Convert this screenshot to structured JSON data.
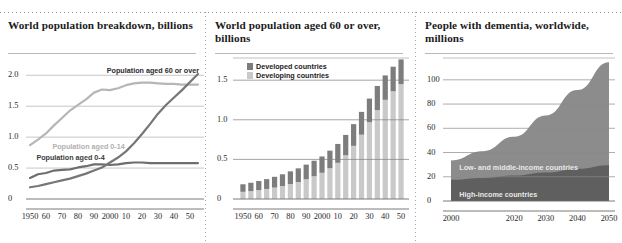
{
  "colors": {
    "dark_line": "#6e6e6e",
    "mid_line": "#8f8f8f",
    "light_line": "#b6b6b6",
    "bar_developed": "#7d7d7d",
    "bar_developing": "#c9c9c9",
    "area_low_mid": "#8c8c8c",
    "area_high": "#5f5f5f",
    "grid": "#b9b9b9",
    "axis": "#6b6b6b",
    "text": "#1b1b1b"
  },
  "panels": [
    {
      "title": "World population breakdown,\nbillions",
      "chart_data": {
        "type": "line",
        "title": "World population breakdown, billions",
        "xlabel": "",
        "ylabel": "billions",
        "xlim": [
          1950,
          2055
        ],
        "ylim": [
          0,
          2.15
        ],
        "grid": true,
        "legend_position": "inline-annotations",
        "y_ticks": [
          0,
          0.5,
          1.0,
          1.5,
          2.0
        ],
        "y_tick_labels": [
          "0",
          "0.5",
          "1.0",
          "1.5",
          "2.0"
        ],
        "x_ticks": [
          1950,
          1960,
          1970,
          1980,
          1990,
          2000,
          2010,
          2020,
          2030,
          2040,
          2050
        ],
        "x_tick_labels": [
          "1950",
          "60",
          "70",
          "80",
          "90",
          "2000",
          "10",
          "20",
          "30",
          "40",
          "50"
        ],
        "series": [
          {
            "name": "Population aged 0-14",
            "color": "#b6b6b6",
            "x": [
              1950,
              1955,
              1960,
              1965,
              1970,
              1975,
              1980,
              1985,
              1990,
              1995,
              2000,
              2005,
              2010,
              2015,
              2020,
              2025,
              2030,
              2035,
              2040,
              2045,
              2050,
              2055
            ],
            "values": [
              0.87,
              0.96,
              1.06,
              1.19,
              1.31,
              1.43,
              1.52,
              1.61,
              1.72,
              1.77,
              1.76,
              1.79,
              1.84,
              1.87,
              1.88,
              1.88,
              1.87,
              1.86,
              1.86,
              1.85,
              1.85,
              1.85
            ]
          },
          {
            "name": "Population aged 0-4",
            "color": "#6e6e6e",
            "x": [
              1950,
              1955,
              1960,
              1965,
              1970,
              1975,
              1980,
              1985,
              1990,
              1995,
              2000,
              2005,
              2010,
              2015,
              2020,
              2025,
              2030,
              2035,
              2040,
              2045,
              2050,
              2055
            ],
            "values": [
              0.34,
              0.4,
              0.42,
              0.46,
              0.47,
              0.48,
              0.51,
              0.53,
              0.56,
              0.56,
              0.55,
              0.56,
              0.58,
              0.59,
              0.59,
              0.58,
              0.58,
              0.58,
              0.58,
              0.58,
              0.58,
              0.58
            ]
          },
          {
            "name": "Population aged 60 or over",
            "color": "#767676",
            "x": [
              1950,
              1955,
              1960,
              1965,
              1970,
              1975,
              1980,
              1985,
              1990,
              1995,
              2000,
              2005,
              2010,
              2015,
              2020,
              2025,
              2030,
              2035,
              2040,
              2045,
              2050,
              2055
            ],
            "values": [
              0.19,
              0.21,
              0.24,
              0.27,
              0.3,
              0.33,
              0.37,
              0.41,
              0.46,
              0.51,
              0.59,
              0.67,
              0.77,
              0.9,
              1.05,
              1.21,
              1.38,
              1.52,
              1.64,
              1.76,
              1.89,
              2.02
            ]
          }
        ],
        "annotations": [
          {
            "text": "Population aged 60 or over",
            "x": 1998,
            "y": 2.07,
            "color": "#2a2a2a"
          },
          {
            "text": "Population aged 0-14",
            "x": 1964,
            "y": 0.84,
            "color": "#b0b0b0"
          },
          {
            "text": "Population aged 0-4",
            "x": 1954,
            "y": 0.66,
            "color": "#3a3a3a"
          }
        ]
      }
    },
    {
      "title": "World population aged 60 or over,\nbillions",
      "chart_data": {
        "type": "bar",
        "subtype": "stacked",
        "title": "World population aged 60 or over, billions",
        "xlabel": "",
        "ylabel": "billions",
        "ylim": [
          0,
          1.78
        ],
        "grid": true,
        "legend_position": "top-left",
        "y_ticks": [
          0,
          0.5,
          1.0,
          1.5
        ],
        "y_tick_labels": [
          "0",
          "0.5",
          "1.0",
          "1.5"
        ],
        "categories": [
          "1950",
          "1955",
          "1960",
          "1965",
          "1970",
          "1975",
          "1980",
          "1985",
          "1990",
          "1995",
          "2000",
          "2005",
          "2010",
          "2015",
          "2020",
          "2025",
          "2030",
          "2035",
          "2040",
          "2045",
          "2050"
        ],
        "x_tick_labels": [
          "1950",
          "60",
          "70",
          "80",
          "90",
          "2000",
          "10",
          "20",
          "30",
          "40",
          "50"
        ],
        "x_tick_indices": [
          0,
          2,
          4,
          6,
          8,
          10,
          12,
          14,
          16,
          18,
          20
        ],
        "series": [
          {
            "name": "Developing countries",
            "color": "#c9c9c9",
            "values": [
              0.091,
              0.1,
              0.113,
              0.127,
              0.144,
              0.164,
              0.188,
              0.214,
              0.249,
              0.287,
              0.331,
              0.389,
              0.457,
              0.552,
              0.671,
              0.812,
              0.969,
              1.122,
              1.252,
              1.36,
              1.45
            ]
          },
          {
            "name": "Developed countries",
            "color": "#7d7d7d",
            "values": [
              0.095,
              0.105,
              0.114,
              0.124,
              0.136,
              0.148,
              0.161,
              0.173,
              0.185,
              0.196,
              0.206,
              0.221,
              0.238,
              0.257,
              0.274,
              0.288,
              0.299,
              0.305,
              0.308,
              0.31,
              0.312
            ]
          }
        ],
        "legend": [
          {
            "label": "Developed countries",
            "color": "#7d7d7d"
          },
          {
            "label": "Developing countries",
            "color": "#c9c9c9"
          }
        ]
      }
    },
    {
      "title": "People with dementia, worldwide,\nmillions",
      "chart_data": {
        "type": "area",
        "subtype": "stacked",
        "title": "People with dementia, worldwide, millions",
        "xlabel": "",
        "ylabel": "millions",
        "xlim": [
          2000,
          2050
        ],
        "ylim": [
          0,
          118
        ],
        "grid": true,
        "legend_position": "inline-annotations",
        "y_ticks": [
          0,
          20,
          40,
          60,
          80,
          100
        ],
        "y_tick_labels": [
          "0",
          "20",
          "40",
          "60",
          "80",
          "100"
        ],
        "x_ticks": [
          2000,
          2010,
          2020,
          2030,
          2040,
          2050
        ],
        "x_tick_labels": [
          "2000",
          "",
          "2020",
          "2030",
          "2040",
          "2050"
        ],
        "x_tick_shown": [
          "2000",
          "2020",
          "2030",
          "2040",
          "2050"
        ],
        "series": [
          {
            "name": "High-income countries",
            "color": "#5f5f5f",
            "x": [
              2000,
              2010,
              2020,
              2030,
              2040,
              2050
            ],
            "values": [
              17.5,
              19.0,
              21.0,
              23.5,
              26.5,
              29.5
            ]
          },
          {
            "name": "Low- and middle-income countries",
            "color": "#8c8c8c",
            "x": [
              2000,
              2010,
              2020,
              2030,
              2040,
              2050
            ],
            "values": [
              16.0,
              22.0,
              32.0,
              47.0,
              65.0,
              85.0
            ]
          }
        ],
        "annotations": [
          {
            "text": "Low- and middle-income countries",
            "x": 2002,
            "y": 27,
            "color": "#e8e8e8"
          },
          {
            "text": "High-income countries",
            "x": 2002,
            "y": 5,
            "color": "#e8e8e8"
          }
        ]
      }
    }
  ]
}
